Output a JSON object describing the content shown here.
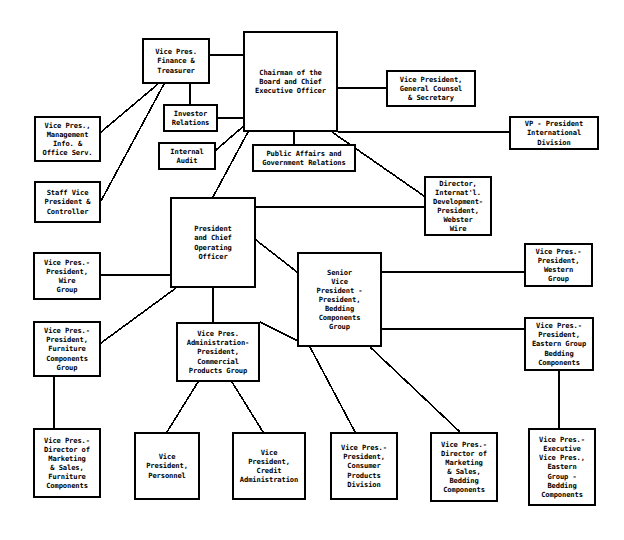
{
  "chart_data": {
    "type": "diagram",
    "diagram_kind": "organizational-chart",
    "orientation": "top-down",
    "node_count": 25,
    "edge_count": 26,
    "colors": {
      "box_border": "#000000",
      "box_fill": "#ffffff",
      "connector": "#000000",
      "text": "#000000",
      "background": "#ffffff"
    },
    "nodes": [
      {
        "id": "chairman",
        "label": "Chairman of the\nBoard and Chief\nExecutive Officer",
        "x": 243,
        "y": 31,
        "w": 95,
        "h": 101
      },
      {
        "id": "vp_finance",
        "label": "Vice Pres.\nFinance &\nTreasurer",
        "x": 142,
        "y": 38,
        "w": 68,
        "h": 46
      },
      {
        "id": "investor_rel",
        "label": "Investor\nRelations",
        "x": 163,
        "y": 104,
        "w": 55,
        "h": 28
      },
      {
        "id": "internal_audit",
        "label": "Internal\nAudit",
        "x": 158,
        "y": 142,
        "w": 58,
        "h": 28
      },
      {
        "id": "vp_mgmt_info",
        "label": "Vice Pres.,\nManagement\nInfo. &\nOffice Serv.",
        "x": 34,
        "y": 116,
        "w": 67,
        "h": 46
      },
      {
        "id": "staff_vp",
        "label": "Staff Vice\nPresident &\nController",
        "x": 34,
        "y": 181,
        "w": 67,
        "h": 42
      },
      {
        "id": "vp_general_counsel",
        "label": "Vice President,\nGeneral Counsel\n& Secretary",
        "x": 386,
        "y": 70,
        "w": 90,
        "h": 37
      },
      {
        "id": "public_affairs",
        "label": "Public Affairs and\nGovernment Relations",
        "x": 252,
        "y": 144,
        "w": 104,
        "h": 28
      },
      {
        "id": "vp_international",
        "label": "VP - President\nInternational\nDivision",
        "x": 509,
        "y": 116,
        "w": 90,
        "h": 34
      },
      {
        "id": "dir_intl_dev",
        "label": "Director,\nInternat'l.\nDevelopment-\nPresident,\nWebster\nWire",
        "x": 424,
        "y": 176,
        "w": 68,
        "h": 60
      },
      {
        "id": "president_coo",
        "label": "President\nand Chief\nOperating\nOfficer",
        "x": 170,
        "y": 197,
        "w": 86,
        "h": 91
      },
      {
        "id": "vp_wire_group",
        "label": "Vice Pres.-\nPresident,\nWire\nGroup",
        "x": 33,
        "y": 252,
        "w": 68,
        "h": 48
      },
      {
        "id": "senior_vp_bedding",
        "label": "Senior\nVice\nPresident -\nPresident,\nBedding\nComponents\nGroup",
        "x": 297,
        "y": 252,
        "w": 85,
        "h": 95
      },
      {
        "id": "vp_western",
        "label": "Vice Pres.-\nPresident,\nWestern\nGroup",
        "x": 524,
        "y": 243,
        "w": 69,
        "h": 44
      },
      {
        "id": "vp_eastern_bedding",
        "label": "Vice Pres.-\nPresident,\nEastern Group\nBedding\nComponents",
        "x": 524,
        "y": 317,
        "w": 70,
        "h": 54
      },
      {
        "id": "vp_furniture_grp",
        "label": "Vice Pres.-\nPresident,\nFurniture\nComponents\nGroup",
        "x": 33,
        "y": 321,
        "w": 68,
        "h": 56
      },
      {
        "id": "vp_admin_comm",
        "label": "Vice Pres.\nAdministration-\nPresident,\nCommercial\nProducts Group",
        "x": 176,
        "y": 322,
        "w": 84,
        "h": 60
      },
      {
        "id": "vp_dir_mkt_furn",
        "label": "Vice Pres.-\nDirector of\nMarketing\n& Sales,\nFurniture\nComponents",
        "x": 33,
        "y": 428,
        "w": 68,
        "h": 70
      },
      {
        "id": "vp_personnel",
        "label": "Vice\nPresident,\nPersonnel",
        "x": 134,
        "y": 432,
        "w": 66,
        "h": 68
      },
      {
        "id": "vp_credit",
        "label": "Vice\nPresident,\nCredit\nAdministration",
        "x": 232,
        "y": 432,
        "w": 74,
        "h": 68
      },
      {
        "id": "vp_consumer",
        "label": "Vice Pres.-\nPresident,\nConsumer\nProducts\nDivision",
        "x": 330,
        "y": 432,
        "w": 68,
        "h": 68
      },
      {
        "id": "vp_dir_mkt_bed",
        "label": "Vice Pres.-\nDirector of\nMarketing\n& Sales,\nBedding\nComponents",
        "x": 430,
        "y": 432,
        "w": 68,
        "h": 70
      },
      {
        "id": "vp_exec_eastern",
        "label": "Vice Pres.-\nExecutive\nVice Pres.,\nEastern\nGroup -\nBedding\nComponents",
        "x": 528,
        "y": 428,
        "w": 68,
        "h": 78
      }
    ],
    "edges": [
      {
        "from": "vp_finance",
        "to": "chairman",
        "x1": 210,
        "y1": 55,
        "x2": 243,
        "y2": 55
      },
      {
        "from": "investor_rel",
        "to": "chairman",
        "x1": 218,
        "y1": 118,
        "x2": 243,
        "y2": 118
      },
      {
        "from": "vp_finance",
        "to": "investor_rel",
        "x1": 190,
        "y1": 84,
        "x2": 190,
        "y2": 104
      },
      {
        "from": "vp_mgmt_info",
        "to": "vp_finance",
        "x1": 101,
        "y1": 132,
        "x2": 158,
        "y2": 84
      },
      {
        "from": "staff_vp",
        "to": "vp_finance",
        "x1": 101,
        "y1": 201,
        "x2": 164,
        "y2": 84
      },
      {
        "from": "internal_audit",
        "to": "chairman",
        "x1": 216,
        "y1": 150,
        "x2": 246,
        "y2": 124
      },
      {
        "from": "chairman",
        "to": "vp_general_counsel",
        "x1": 338,
        "y1": 88,
        "x2": 386,
        "y2": 88
      },
      {
        "from": "chairman",
        "to": "vp_international",
        "x1": 338,
        "y1": 132,
        "x2": 509,
        "y2": 132
      },
      {
        "from": "chairman",
        "to": "public_affairs",
        "x1": 294,
        "y1": 132,
        "x2": 294,
        "y2": 144
      },
      {
        "from": "chairman",
        "to": "dir_intl_dev",
        "x1": 332,
        "y1": 132,
        "x2": 424,
        "y2": 196
      },
      {
        "from": "chairman",
        "to": "president_coo",
        "x1": 248,
        "y1": 132,
        "x2": 213,
        "y2": 197
      },
      {
        "from": "president_coo",
        "to": "vp_wire_group",
        "x1": 170,
        "y1": 275,
        "x2": 101,
        "y2": 275
      },
      {
        "from": "president_coo",
        "to": "dir_intl_dev",
        "x1": 256,
        "y1": 207,
        "x2": 424,
        "y2": 207
      },
      {
        "from": "president_coo",
        "to": "senior_vp_bedding",
        "x1": 256,
        "y1": 240,
        "x2": 297,
        "y2": 272
      },
      {
        "from": "president_coo",
        "to": "vp_furniture_grp",
        "x1": 176,
        "y1": 288,
        "x2": 101,
        "y2": 343
      },
      {
        "from": "president_coo",
        "to": "vp_admin_comm",
        "x1": 213,
        "y1": 288,
        "x2": 213,
        "y2": 322
      },
      {
        "from": "senior_vp_bedding",
        "to": "vp_western",
        "x1": 382,
        "y1": 272,
        "x2": 524,
        "y2": 272
      },
      {
        "from": "senior_vp_bedding",
        "to": "vp_eastern_bedding",
        "x1": 382,
        "y1": 329,
        "x2": 524,
        "y2": 329
      },
      {
        "from": "senior_vp_bedding",
        "to": "vp_consumer",
        "x1": 310,
        "y1": 347,
        "x2": 355,
        "y2": 432
      },
      {
        "from": "senior_vp_bedding",
        "to": "vp_dir_mkt_bed",
        "x1": 370,
        "y1": 347,
        "x2": 460,
        "y2": 432
      },
      {
        "from": "vp_eastern_bedding",
        "to": "vp_exec_eastern",
        "x1": 559,
        "y1": 371,
        "x2": 559,
        "y2": 428
      },
      {
        "from": "vp_furniture_grp",
        "to": "vp_dir_mkt_furn",
        "x1": 54,
        "y1": 377,
        "x2": 54,
        "y2": 428
      },
      {
        "from": "vp_admin_comm",
        "to": "vp_personnel",
        "x1": 198,
        "y1": 382,
        "x2": 167,
        "y2": 432
      },
      {
        "from": "vp_admin_comm",
        "to": "vp_credit",
        "x1": 232,
        "y1": 382,
        "x2": 263,
        "y2": 432
      },
      {
        "from": "vp_admin_comm",
        "to": "senior_vp_bedding",
        "x1": 260,
        "y1": 322,
        "x2": 310,
        "y2": 347
      }
    ]
  }
}
